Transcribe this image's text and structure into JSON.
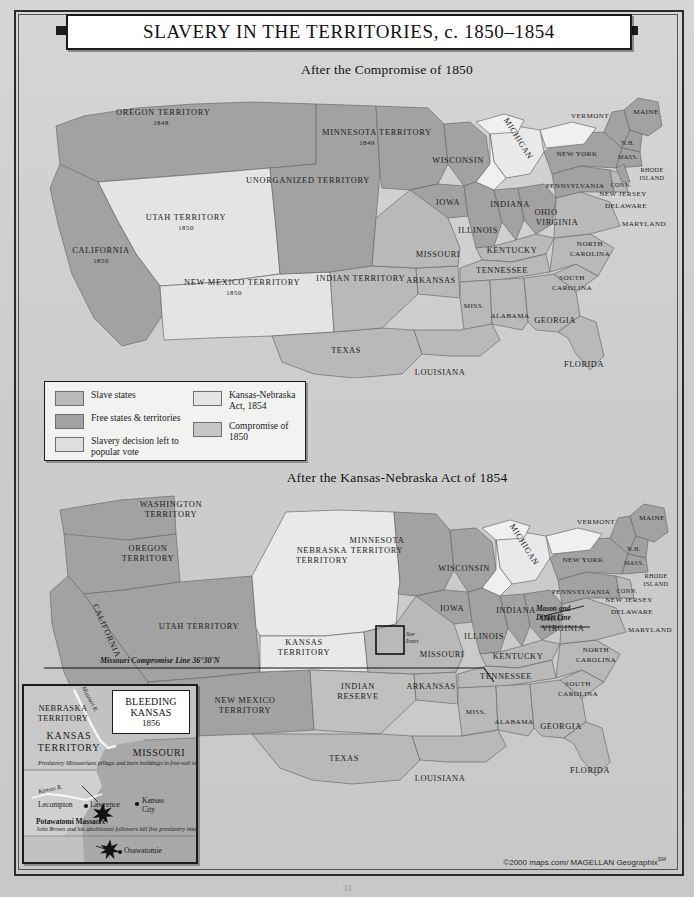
{
  "title": "SLAVERY IN THE TERRITORIES, c. 1850–1854",
  "maps": [
    {
      "id": "top",
      "subtitle": "After the Compromise of 1850"
    },
    {
      "id": "bottom",
      "subtitle": "After the Kansas-Nebraska Act of 1854"
    }
  ],
  "legend": {
    "column1": [
      {
        "label": "Slave states",
        "color": "#b9b9b9"
      },
      {
        "label": "Free states & territories",
        "color": "#a2a2a2"
      },
      {
        "label": "Slavery decision left to popular vote",
        "color": "#dedede"
      }
    ],
    "column2": [
      {
        "label": "Kansas-Nebraska Act, 1854",
        "color": "#e4e4e4"
      },
      {
        "label": "Compromise of 1850",
        "color": "#c6c6c6"
      }
    ]
  },
  "top_map_labels": {
    "territories": [
      {
        "name": "OREGON TERRITORY",
        "year": "1848"
      },
      {
        "name": "UTAH TERRITORY",
        "year": "1850"
      },
      {
        "name": "NEW MEXICO TERRITORY",
        "year": "1850"
      },
      {
        "name": "UNORGANIZED TERRITORY",
        "year": ""
      },
      {
        "name": "MINNESOTA TERRITORY",
        "year": "1849"
      },
      {
        "name": "INDIAN TERRITORY",
        "year": ""
      }
    ],
    "states": [
      "CALIFORNIA",
      "WISCONSIN",
      "MICHIGAN",
      "IOWA",
      "ILLINOIS",
      "INDIANA",
      "OHIO",
      "MISSOURI",
      "KENTUCKY",
      "ARKANSAS",
      "TENNESSEE",
      "TEXAS",
      "LOUISIANA",
      "MISS.",
      "ALABAMA",
      "GEORGIA",
      "FLORIDA",
      "SOUTH CAROLINA",
      "NORTH CAROLINA",
      "VIRGINIA",
      "MARYLAND",
      "DELAWARE",
      "NEW JERSEY",
      "PENNSYLVANIA",
      "NEW YORK",
      "VERMONT",
      "MAINE",
      "N.H.",
      "MASS.",
      "RHODE ISLAND",
      "CONN."
    ],
    "california_year": "1850"
  },
  "bottom_map_labels": {
    "territories": [
      "WASHINGTON TERRITORY",
      "OREGON TERRITORY",
      "UTAH TERRITORY",
      "NEW MEXICO TERRITORY",
      "NEBRASKA TERRITORY",
      "KANSAS TERRITORY",
      "MINNESOTA TERRITORY",
      "INDIAN RESERVE"
    ],
    "states": [
      "CALIFORNIA",
      "WISCONSIN",
      "MICHIGAN",
      "IOWA",
      "ILLINOIS",
      "INDIANA",
      "OHIO",
      "MISSOURI",
      "KENTUCKY",
      "ARKANSAS",
      "TENNESSEE",
      "TEXAS",
      "LOUISIANA",
      "MISS.",
      "ALABAMA",
      "GEORGIA",
      "FLORIDA",
      "SOUTH CAROLINA",
      "NORTH CAROLINA",
      "VIRGINIA",
      "MARYLAND",
      "DELAWARE",
      "NEW JERSEY",
      "PENNSYLVANIA",
      "NEW YORK",
      "VERMONT",
      "MAINE",
      "N.H.",
      "MASS.",
      "RHODE ISLAND",
      "CONN."
    ],
    "annotations": [
      "Missouri Compromise Line 36°30'N",
      "Mason and Dixon Line",
      "See Inset"
    ]
  },
  "inset": {
    "title_line1": "BLEEDING",
    "title_line2": "KANSAS",
    "title_year": "1856",
    "territories": [
      "NEBRASKA TERRITORY",
      "KANSAS TERRITORY",
      "MISSOURI"
    ],
    "rivers": [
      "Missouri R.",
      "Kansas R."
    ],
    "cities": [
      "Lecompton",
      "Lawrence",
      "Kansas City",
      "Osawatomie"
    ],
    "note_lawrence": "Proslavery Missourians pillage and burn buildings in free-soil town of Lawrence (May 21, 1856).",
    "note_potawatomi_title": "Potawatomi Massacre",
    "note_potawatomi_body": "John Brown and his abolitionist followers kill five proslavery immigrants settled along Potawatomi Creek (May 24, 1856)."
  },
  "credit": "©2000 maps.com/ MAGELLAN Geographix",
  "credit_sup": "SM",
  "page_number": "33"
}
